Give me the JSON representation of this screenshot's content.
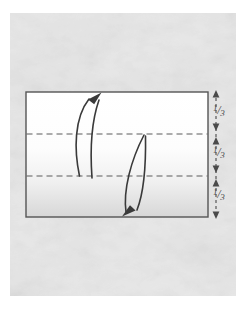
{
  "figure": {
    "type": "instructional-fold-diagram",
    "canvas": {
      "width": 247,
      "height": 319,
      "background": "#ffffff"
    }
  },
  "panel": {
    "name": "textured paper background",
    "x": 10,
    "y": 13,
    "width": 226,
    "height": 283,
    "fill": "#e9e9e9",
    "texture": "mottled-paper"
  },
  "sheet": {
    "name": "paper sheet rectangle",
    "x": 26,
    "y": 92,
    "width": 182,
    "height": 125,
    "stroke": "#555555",
    "stroke_width": 1.4,
    "fill_top": "#ffffff",
    "fill_bottom": "#d8d8d8"
  },
  "crease_lines": [
    {
      "id": "crease-upper",
      "y": 134,
      "x1": 26,
      "x2": 208,
      "style": "dashed",
      "color": "#555555",
      "label": "valley fold at one third"
    },
    {
      "id": "crease-lower",
      "y": 176,
      "x1": 26,
      "x2": 208,
      "style": "dashed",
      "color": "#555555",
      "label": "valley fold at two thirds"
    }
  ],
  "fold_arrows": [
    {
      "id": "arrow-up",
      "direction": "up",
      "description": "bottom third folds upward to top edge",
      "start": {
        "x": 79,
        "y": 176
      },
      "end": {
        "x": 101,
        "y": 94
      },
      "color": "#3a3a3a"
    },
    {
      "id": "arrow-down",
      "direction": "down",
      "description": "top third folds downward to bottom edge",
      "start": {
        "x": 144,
        "y": 135
      },
      "end": {
        "x": 125,
        "y": 215
      },
      "color": "#3a3a3a"
    }
  ],
  "measure_axis": {
    "name": "thirds measurement scale",
    "x": 216,
    "top": 92,
    "bottom": 217,
    "color": "#4a4a4a",
    "ticks": [
      92,
      134,
      176,
      217
    ],
    "segments": [
      {
        "id": "segment-1",
        "from": 92,
        "to": 134,
        "numerator": "1",
        "solidus": "/",
        "denominator": "3",
        "text": "1/3"
      },
      {
        "id": "segment-2",
        "from": 134,
        "to": 176,
        "numerator": "1",
        "solidus": "/",
        "denominator": "3",
        "text": "1/3"
      },
      {
        "id": "segment-3",
        "from": 176,
        "to": 217,
        "numerator": "1",
        "solidus": "/",
        "denominator": "3",
        "text": "1/3"
      }
    ]
  }
}
